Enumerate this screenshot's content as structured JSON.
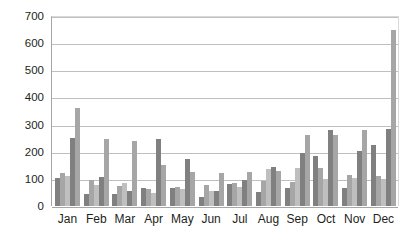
{
  "chart_data": {
    "type": "bar",
    "title": "",
    "subtitle": "",
    "xlabel": "",
    "ylabel": "",
    "grid": true,
    "legend": "none",
    "ylim": [
      0,
      700
    ],
    "yticks": [
      "0",
      "100",
      "200",
      "300",
      "400",
      "500",
      "600",
      "700"
    ],
    "ytick_values": [
      0,
      100,
      200,
      300,
      400,
      500,
      600,
      700
    ],
    "categories": [
      "Jan",
      "Feb",
      "Mar",
      "Apr",
      "May",
      "Jun",
      "Jul",
      "Aug",
      "Sep",
      "Oct",
      "Nov",
      "Dec"
    ],
    "series": [
      {
        "name": "Series 1",
        "color": "#808080",
        "values": [
          105,
          45,
          43,
          65,
          67,
          32,
          82,
          50,
          65,
          183,
          65,
          225
        ]
      },
      {
        "name": "Series 2",
        "color": "#a6a6a6",
        "values": [
          120,
          97,
          75,
          63,
          70,
          76,
          85,
          92,
          88,
          140,
          113,
          112
        ]
      },
      {
        "name": "Series 3",
        "color": "#bfbfbf",
        "values": [
          112,
          78,
          85,
          48,
          62,
          55,
          70,
          135,
          140,
          100,
          103,
          100
        ]
      },
      {
        "name": "Series 4",
        "color": "#808080",
        "values": [
          250,
          107,
          55,
          248,
          172,
          57,
          95,
          142,
          195,
          281,
          203,
          282
        ]
      },
      {
        "name": "Series 5",
        "color": "#a6a6a6",
        "values": [
          362,
          247,
          238,
          150,
          124,
          121,
          126,
          130,
          260,
          260,
          281,
          648
        ]
      }
    ],
    "bar_colors": [
      "#808080",
      "#a6a6a6",
      "#bfbfbf",
      "#808080",
      "#a6a6a6"
    ],
    "plot_background": "#ffffff",
    "gridline_color": "#bfbfbf",
    "axis_color": "#a6a6a6",
    "text_color": "#231f20"
  }
}
